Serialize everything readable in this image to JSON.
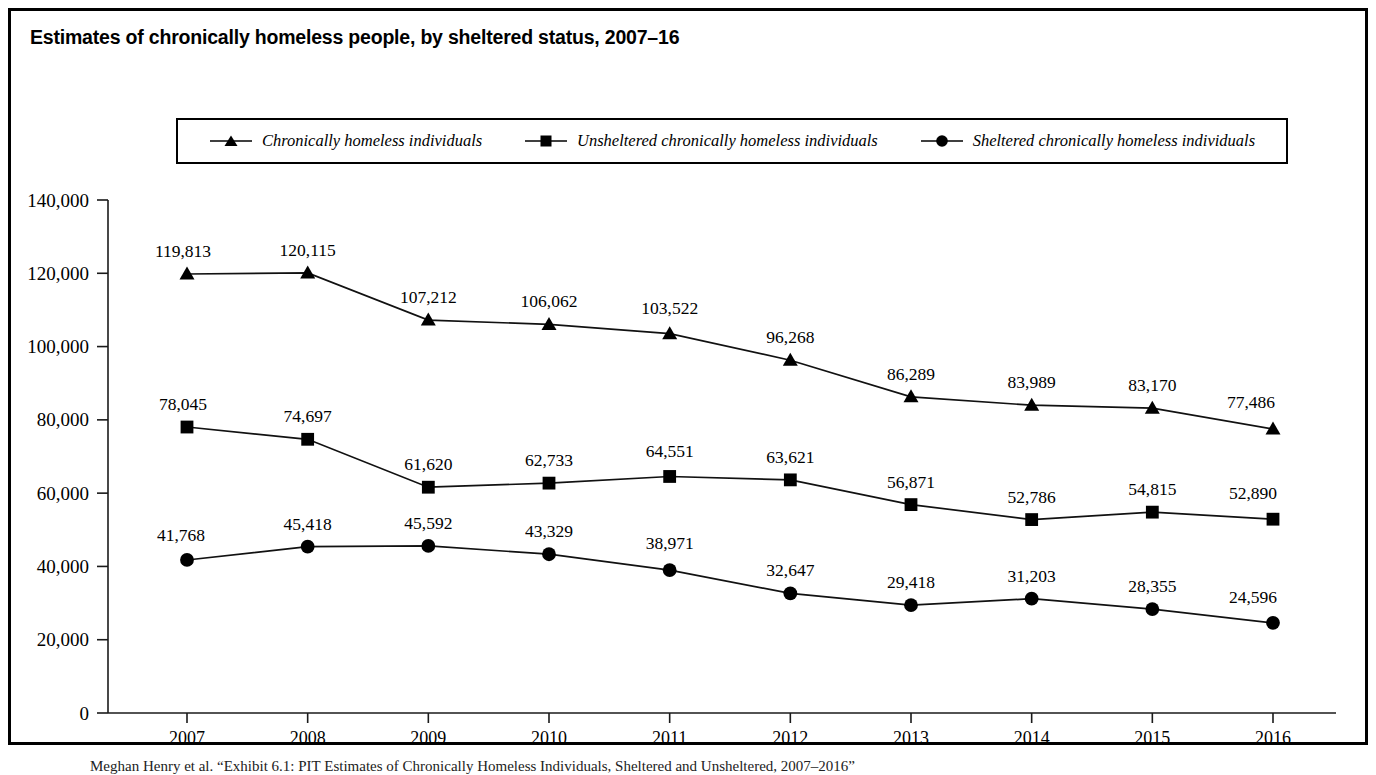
{
  "figure": {
    "title": "Estimates of chronically homeless people, by sheltered status, 2007–16",
    "footnote": "Meghan Henry et al. “Exhibit 6.1: PIT Estimates of Chronically Homeless Individuals, Sheltered and Unsheltered, 2007–2016”"
  },
  "legend": {
    "items": [
      {
        "label": "Chronically homeless individuals",
        "marker": "triangle-marker-icon"
      },
      {
        "label": "Unsheltered chronically homeless individuals",
        "marker": "square-marker-icon"
      },
      {
        "label": "Sheltered chronically homeless individuals",
        "marker": "circle-marker-icon"
      }
    ]
  },
  "axes": {
    "y_ticks": [
      "140,000",
      "120,000",
      "100,000",
      "80,000",
      "60,000",
      "40,000",
      "20,000",
      "0"
    ],
    "x_ticks": [
      "2007",
      "2008",
      "2009",
      "2010",
      "2011",
      "2012",
      "2013",
      "2014",
      "2015",
      "2016"
    ]
  },
  "chart_data": {
    "type": "line",
    "title": "Estimates of chronically homeless people, by sheltered status, 2007–16",
    "xlabel": "",
    "ylabel": "",
    "x": [
      2007,
      2008,
      2009,
      2010,
      2011,
      2012,
      2013,
      2014,
      2015,
      2016
    ],
    "categories": [
      "2007",
      "2008",
      "2009",
      "2010",
      "2011",
      "2012",
      "2013",
      "2014",
      "2015",
      "2016"
    ],
    "ylim": [
      0,
      140000
    ],
    "ytick_step": 20000,
    "grid": false,
    "legend_position": "top",
    "series": [
      {
        "name": "Chronically homeless individuals",
        "marker": "triangle",
        "values": [
          119813,
          120115,
          107212,
          106062,
          103522,
          96268,
          86289,
          83989,
          83170,
          77486
        ],
        "labels": [
          "119,813",
          "120,115",
          "107,212",
          "106,062",
          "103,522",
          "96,268",
          "86,289",
          "83,989",
          "83,170",
          "77,486"
        ]
      },
      {
        "name": "Unsheltered chronically homeless individuals",
        "marker": "square",
        "values": [
          78045,
          74697,
          61620,
          62733,
          64551,
          63621,
          56871,
          52786,
          54815,
          52890
        ],
        "labels": [
          "78,045",
          "74,697",
          "61,620",
          "62,733",
          "64,551",
          "63,621",
          "56,871",
          "52,786",
          "54,815",
          "52,890"
        ]
      },
      {
        "name": "Sheltered chronically homeless individuals",
        "marker": "circle",
        "values": [
          41768,
          45418,
          45592,
          43329,
          38971,
          32647,
          29418,
          31203,
          28355,
          24596
        ],
        "labels": [
          "41,768",
          "45,418",
          "45,592",
          "43,329",
          "38,971",
          "32,647",
          "29,418",
          "31,203",
          "28,355",
          "24,596"
        ]
      }
    ]
  },
  "colors": {
    "ink": "#000000",
    "axis": "#1a1a1a",
    "background": "#ffffff"
  }
}
